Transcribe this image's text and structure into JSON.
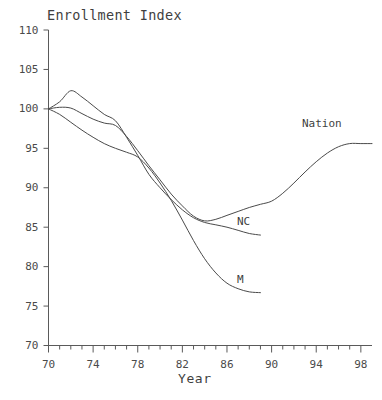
{
  "chart_data": {
    "type": "line",
    "title": "Enrollment Index",
    "xlabel": "Year",
    "ylabel": "",
    "xlim": [
      70,
      99
    ],
    "ylim": [
      70,
      110
    ],
    "grid": false,
    "legend_position": "inline-right-of-line-ends",
    "x_major_ticks": [
      70,
      74,
      78,
      82,
      86,
      90,
      94,
      98
    ],
    "x_minor_tick_step": 1,
    "y_ticks": [
      70,
      75,
      80,
      85,
      90,
      95,
      100,
      105,
      110
    ],
    "y_tick_labels": [
      "70",
      "75",
      "80",
      "85",
      "90",
      "95",
      "100",
      "105",
      "110"
    ],
    "x_tick_labels": [
      "70",
      "74",
      "78",
      "82",
      "86",
      "90",
      "94",
      "98"
    ],
    "series": [
      {
        "name": "Nation",
        "label": "Nation",
        "color": "#4a4a4a",
        "x": [
          70,
          71,
          72,
          73,
          74,
          75,
          76,
          77,
          78,
          79,
          80,
          81,
          82,
          83,
          84,
          85,
          86,
          87,
          88,
          89,
          90,
          91,
          92,
          93,
          94,
          95,
          96,
          97,
          98,
          99
        ],
        "y": [
          100.0,
          100.2,
          100.1,
          99.4,
          98.7,
          98.2,
          97.9,
          96.5,
          94.7,
          92.8,
          91.0,
          89.2,
          87.7,
          86.4,
          85.8,
          86.0,
          86.5,
          87.0,
          87.5,
          87.9,
          88.3,
          89.3,
          90.6,
          92.0,
          93.3,
          94.4,
          95.2,
          95.6,
          95.6,
          95.6
        ]
      },
      {
        "name": "NC",
        "label": "NC",
        "color": "#4a4a4a",
        "x": [
          70,
          71,
          72,
          73,
          74,
          75,
          76,
          77,
          78,
          79,
          80,
          81,
          82,
          83,
          84,
          85,
          86,
          87,
          88,
          89
        ],
        "y": [
          100.0,
          100.9,
          102.3,
          101.5,
          100.4,
          99.3,
          98.5,
          96.4,
          94.1,
          91.7,
          90.0,
          88.5,
          87.2,
          86.2,
          85.6,
          85.3,
          85.0,
          84.6,
          84.2,
          84.0
        ]
      },
      {
        "name": "M",
        "label": "M",
        "color": "#4a4a4a",
        "x": [
          70,
          71,
          72,
          73,
          74,
          75,
          76,
          77,
          78,
          79,
          80,
          81,
          82,
          83,
          84,
          85,
          86,
          87,
          88,
          89
        ],
        "y": [
          100.0,
          99.3,
          98.3,
          97.3,
          96.4,
          95.6,
          95.0,
          94.5,
          93.9,
          92.5,
          90.6,
          88.4,
          85.9,
          83.3,
          81.0,
          79.2,
          77.9,
          77.2,
          76.8,
          76.7
        ]
      }
    ],
    "annotations": [
      {
        "text": "Nation",
        "x_px": 302,
        "y_px": 118
      },
      {
        "text": "NC",
        "x_px": 237,
        "y_px": 216
      },
      {
        "text": "M",
        "x_px": 237,
        "y_px": 274
      }
    ]
  }
}
